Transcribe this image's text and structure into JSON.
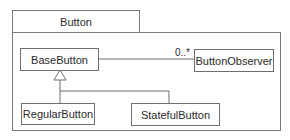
{
  "diagram": {
    "type": "uml-class-diagram",
    "package": {
      "name": "Button"
    },
    "classes": [
      {
        "id": "base",
        "name": "BaseButton"
      },
      {
        "id": "observer",
        "name": "ButtonObserver"
      },
      {
        "id": "regular",
        "name": "RegularButton"
      },
      {
        "id": "stateful",
        "name": "StatefulButton"
      }
    ],
    "relationships": [
      {
        "type": "association",
        "from": "BaseButton",
        "to": "ButtonObserver",
        "multiplicity_to": "0..*"
      },
      {
        "type": "generalization",
        "from": "RegularButton",
        "to": "BaseButton"
      },
      {
        "type": "generalization",
        "from": "StatefulButton",
        "to": "BaseButton"
      }
    ],
    "colors": {
      "line": "#6f6f6f",
      "text": "#2a2a2a",
      "background": "#ffffff"
    }
  }
}
